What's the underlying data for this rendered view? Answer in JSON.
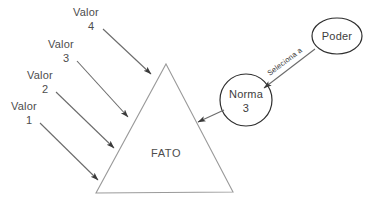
{
  "diagram": {
    "title_present": false,
    "background_color": "#ffffff",
    "shape_stroke_color": "#9a9a9a",
    "node_stroke_color": "#2e2e2e",
    "arrow_color": "#6b6b6b",
    "text_color": "#4d4d4d",
    "central_shape": {
      "kind": "triangle",
      "label": "FATO"
    },
    "value_inputs": [
      {
        "name": "Valor",
        "number": "4"
      },
      {
        "name": "Valor",
        "number": "3"
      },
      {
        "name": "Valor",
        "number": "2"
      },
      {
        "name": "Valor",
        "number": "1"
      }
    ],
    "nodes": [
      {
        "id": "norma",
        "label": "Norma",
        "number": "3",
        "shape": "circle"
      },
      {
        "id": "poder",
        "label": "Poder",
        "number": "",
        "shape": "ellipse"
      }
    ],
    "edges": [
      {
        "from": "poder",
        "to": "norma",
        "label": "Seleciona a"
      },
      {
        "from": "norma",
        "to": "fato",
        "label": ""
      }
    ]
  }
}
